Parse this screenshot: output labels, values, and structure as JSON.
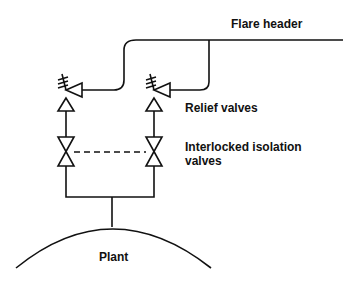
{
  "labels": {
    "flare_header": "Flare header",
    "relief_valves": "Relief valves",
    "isolation_line1": "Interlocked isolation",
    "isolation_line2": "valves",
    "plant": "Plant"
  },
  "colors": {
    "line": "#111111",
    "background": "#ffffff"
  }
}
